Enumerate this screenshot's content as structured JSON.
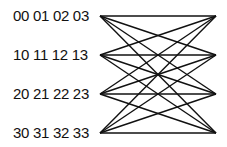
{
  "diagram": {
    "type": "complete-bipartite-graph",
    "left_nodes": [
      {
        "label": "00 01 02 03",
        "y": 16
      },
      {
        "label": "10 11 12 13",
        "y": 55
      },
      {
        "label": "20 21 22 23",
        "y": 94
      },
      {
        "label": "30 31 32 33",
        "y": 133
      }
    ],
    "right_nodes": [
      {
        "y": 16
      },
      {
        "y": 55
      },
      {
        "y": 94
      },
      {
        "y": 133
      }
    ],
    "left_x": 100,
    "right_x": 216,
    "edge_color": "#111111",
    "edges": "all left nodes connected to all right nodes (16 edges)"
  }
}
